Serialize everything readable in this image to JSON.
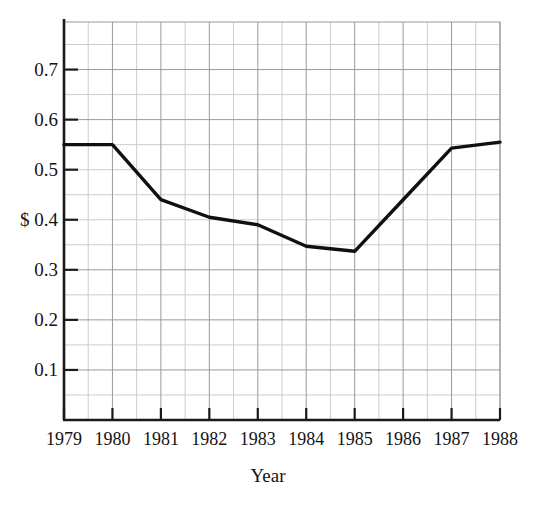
{
  "chart_data": {
    "type": "line",
    "title": "",
    "xlabel": "Year",
    "ylabel": "",
    "categories": [
      "1979",
      "1980",
      "1981",
      "1982",
      "1983",
      "1984",
      "1985",
      "1986",
      "1987",
      "1988"
    ],
    "x": [
      1979,
      1980,
      1981,
      1982,
      1983,
      1984,
      1985,
      1986,
      1987,
      1988
    ],
    "values": [
      0.55,
      0.55,
      0.44,
      0.405,
      0.39,
      0.347,
      0.337,
      0.44,
      0.543,
      0.555
    ],
    "series": [
      {
        "name": "price",
        "values": [
          0.55,
          0.55,
          0.44,
          0.405,
          0.39,
          0.347,
          0.337,
          0.44,
          0.543,
          0.555
        ]
      }
    ],
    "xlim": [
      1979,
      1988
    ],
    "ylim": [
      0.0,
      0.795
    ],
    "y_ticks": [
      0.1,
      0.2,
      0.3,
      0.4,
      0.5,
      0.6,
      0.7
    ],
    "y_tick_labels": [
      "0.1",
      "0.2",
      "0.3",
      "0.4",
      "0.5",
      "0.6",
      "0.7"
    ],
    "y_tick_label_prefix_index": 3,
    "y_tick_label_prefix": "$ ",
    "y_minor_step": 0.05,
    "x_minor_step": 0.5,
    "grid": true,
    "grid_color": "#9a9a9a",
    "minor_grid_color": "#cccccc",
    "legend": "none",
    "line_color": "#101010",
    "line_width": 3.4,
    "axis_color": "#1a1a1a",
    "background": "#ffffff"
  },
  "axes": {
    "y_labels": [
      {
        "text": "0.7",
        "value": 0.7
      },
      {
        "text": "0.6",
        "value": 0.6
      },
      {
        "text": "0.5",
        "value": 0.5
      },
      {
        "text": "$ 0.4",
        "value": 0.4
      },
      {
        "text": "0.3",
        "value": 0.3
      },
      {
        "text": "0.2",
        "value": 0.2
      },
      {
        "text": "0.1",
        "value": 0.1
      }
    ],
    "x_labels": [
      {
        "text": "1979",
        "value": 1979
      },
      {
        "text": "1980",
        "value": 1980
      },
      {
        "text": "1981",
        "value": 1981
      },
      {
        "text": "1982",
        "value": 1982
      },
      {
        "text": "1983",
        "value": 1983
      },
      {
        "text": "1984",
        "value": 1984
      },
      {
        "text": "1985",
        "value": 1985
      },
      {
        "text": "1986",
        "value": 1986
      },
      {
        "text": "1987",
        "value": 1987
      },
      {
        "text": "1988",
        "value": 1988
      }
    ],
    "x_title": "Year"
  }
}
